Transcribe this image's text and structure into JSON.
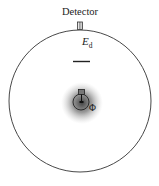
{
  "diagram": {
    "detector_label": "Detector",
    "energy_label_main": "E",
    "energy_label_sub": "d",
    "flux_label": "Φ",
    "colors": {
      "stroke": "#333333",
      "background": "#ffffff",
      "source_glow": "#555555"
    }
  }
}
